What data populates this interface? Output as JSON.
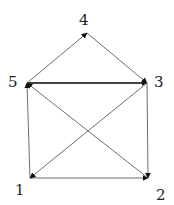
{
  "diagram": {
    "type": "directed-graph",
    "nodes": [
      {
        "id": "1",
        "label": "1",
        "x": 30,
        "y": 178,
        "lx": 15,
        "ly": 195
      },
      {
        "id": "2",
        "label": "2",
        "x": 148,
        "y": 178,
        "lx": 156,
        "ly": 200
      },
      {
        "id": "3",
        "label": "3",
        "x": 147,
        "y": 83,
        "lx": 154,
        "ly": 87
      },
      {
        "id": "4",
        "label": "4",
        "x": 87,
        "y": 33,
        "lx": 79,
        "ly": 25
      },
      {
        "id": "5",
        "label": "5",
        "x": 27,
        "y": 83,
        "lx": 8,
        "ly": 87
      }
    ],
    "edges": [
      {
        "from": "5",
        "to": "4",
        "style": "thin"
      },
      {
        "from": "4",
        "to": "3",
        "style": "thin"
      },
      {
        "from": "5",
        "to": "3",
        "style": "thick"
      },
      {
        "from": "1",
        "to": "5",
        "style": "thin"
      },
      {
        "from": "3",
        "to": "2",
        "style": "thin"
      },
      {
        "from": "1",
        "to": "2",
        "style": "thin"
      },
      {
        "from": "3",
        "to": "1",
        "style": "thin"
      },
      {
        "from": "2",
        "to": "5",
        "style": "thin"
      }
    ],
    "colors": {
      "thin": "#6e6e6e",
      "thick": "#444444",
      "arrow": "#111111",
      "label": "#222222"
    }
  }
}
